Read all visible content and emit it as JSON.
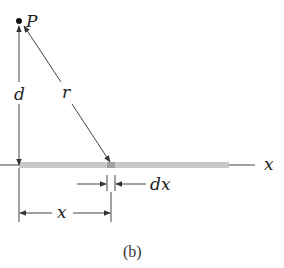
{
  "diagram": {
    "caption": "(b)",
    "point": {
      "label": "P"
    },
    "labels": {
      "distance_perpendicular": "d",
      "distance_radial": "r",
      "axis": "x",
      "element_width": "dx",
      "position": "x"
    },
    "colors": {
      "line": "#444444",
      "rod": "#c8c8c8",
      "rod_element": "#a8a8a8",
      "point": "#111111"
    }
  }
}
